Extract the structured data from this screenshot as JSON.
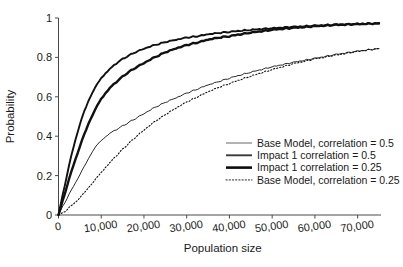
{
  "chart_data": {
    "type": "line",
    "title": "",
    "xlabel": "Population size",
    "ylabel": "Probability",
    "xlim": [
      0,
      75000
    ],
    "ylim": [
      0,
      1
    ],
    "grid": false,
    "legend_position": "inside-bottom-right",
    "x_ticks": [
      0,
      10000,
      20000,
      30000,
      40000,
      50000,
      60000,
      70000
    ],
    "x_tick_labels": [
      "0",
      "10,000",
      "20,000",
      "30,000",
      "40,000",
      "50,000",
      "60,000",
      "70,000"
    ],
    "y_ticks": [
      0,
      0.2,
      0.4,
      0.6,
      0.8,
      1
    ],
    "y_tick_labels": [
      "0",
      "0.2",
      "0.4",
      "0.6",
      "0.8",
      "1"
    ],
    "x": [
      0,
      1000,
      2000,
      3000,
      4000,
      5000,
      6000,
      7000,
      8000,
      9000,
      10000,
      12000,
      14000,
      16000,
      18000,
      20000,
      22500,
      25000,
      27500,
      30000,
      32500,
      35000,
      37500,
      40000,
      45000,
      50000,
      55000,
      60000,
      65000,
      70000,
      75000
    ],
    "series": [
      {
        "name": "Base Model, correlation = 0.5",
        "style": "solid",
        "width": 0.9,
        "color": "#555555",
        "values": [
          0,
          0.045,
          0.085,
          0.125,
          0.165,
          0.205,
          0.245,
          0.285,
          0.325,
          0.355,
          0.378,
          0.415,
          0.44,
          0.465,
          0.49,
          0.515,
          0.545,
          0.572,
          0.595,
          0.618,
          0.64,
          0.66,
          0.677,
          0.695,
          0.725,
          0.752,
          0.775,
          0.795,
          0.815,
          0.832,
          0.845
        ]
      },
      {
        "name": "Impact 1 correlation = 0.5",
        "style": "solid",
        "width": 1.9,
        "color": "#3a3a3a",
        "values": [
          0,
          0.105,
          0.205,
          0.3,
          0.385,
          0.46,
          0.525,
          0.578,
          0.625,
          0.662,
          0.695,
          0.742,
          0.778,
          0.805,
          0.827,
          0.845,
          0.862,
          0.878,
          0.89,
          0.9,
          0.908,
          0.917,
          0.924,
          0.93,
          0.94,
          0.948,
          0.955,
          0.961,
          0.966,
          0.97,
          0.972
        ]
      },
      {
        "name": "Impact 1 correlation = 0.25",
        "style": "solid",
        "width": 2.4,
        "color": "#0d0d0d",
        "values": [
          0,
          0.075,
          0.148,
          0.218,
          0.285,
          0.348,
          0.408,
          0.462,
          0.51,
          0.552,
          0.59,
          0.645,
          0.685,
          0.72,
          0.748,
          0.772,
          0.8,
          0.826,
          0.846,
          0.862,
          0.876,
          0.89,
          0.9,
          0.908,
          0.926,
          0.94,
          0.95,
          0.958,
          0.965,
          0.969,
          0.973
        ]
      },
      {
        "name": "Base Model, correlation = 0.25",
        "style": "dotted",
        "width": 1.1,
        "color": "#3a3a3a",
        "values": [
          0,
          0.012,
          0.028,
          0.046,
          0.066,
          0.088,
          0.112,
          0.138,
          0.164,
          0.19,
          0.216,
          0.266,
          0.312,
          0.355,
          0.395,
          0.432,
          0.473,
          0.51,
          0.543,
          0.573,
          0.6,
          0.625,
          0.648,
          0.668,
          0.705,
          0.738,
          0.768,
          0.792,
          0.812,
          0.83,
          0.845
        ]
      }
    ]
  },
  "legend": {
    "items": [
      {
        "label": "Base Model, correlation = 0.5",
        "style": "thin-solid"
      },
      {
        "label": "Impact 1 correlation = 0.5",
        "style": "medium-solid"
      },
      {
        "label": "Impact 1 correlation = 0.25",
        "style": "thick-solid"
      },
      {
        "label": "Base Model, correlation = 0.25",
        "style": "dotted"
      }
    ]
  },
  "axes": {
    "x_title": "Population size",
    "y_title": "Probability"
  },
  "colors": {
    "background": "#ffffff",
    "axis": "#4a4a4a",
    "text": "#1a1a1a",
    "curve_dark": "#0d0d0d",
    "curve_mid": "#3a3a3a",
    "curve_light": "#555555"
  }
}
